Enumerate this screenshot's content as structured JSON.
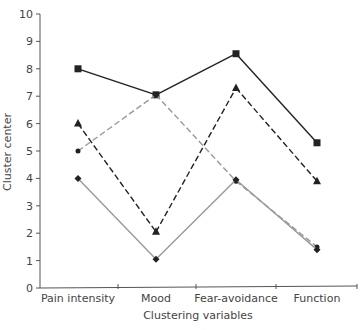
{
  "chart_data": {
    "type": "line",
    "title": "",
    "xlabel": "Clustering variables",
    "ylabel": "Cluster center",
    "categories": [
      "Pain intensity",
      "Mood",
      "Fear-avoidance",
      "Function"
    ],
    "ylim": [
      0,
      10
    ],
    "yticks": [
      0,
      1,
      2,
      3,
      4,
      5,
      6,
      7,
      8,
      9,
      10
    ],
    "grid": false,
    "legend": "none",
    "series": [
      {
        "name": "Cluster 1",
        "marker": "square",
        "line": "solid",
        "color": "#222222",
        "values": [
          8.0,
          7.05,
          8.55,
          5.3
        ]
      },
      {
        "name": "Cluster 2",
        "marker": "triangle",
        "line": "dashed",
        "color": "#222222",
        "values": [
          6.0,
          2.05,
          7.3,
          3.9
        ]
      },
      {
        "name": "Cluster 3",
        "marker": "circle",
        "line": "dashed",
        "color": "#999999",
        "values": [
          5.0,
          7.05,
          3.9,
          1.5
        ]
      },
      {
        "name": "Cluster 4",
        "marker": "diamond",
        "line": "solid",
        "color": "#999999",
        "values": [
          4.0,
          1.05,
          3.95,
          1.4
        ]
      }
    ]
  }
}
